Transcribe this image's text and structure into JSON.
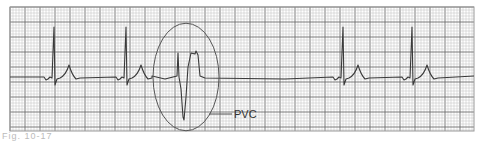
{
  "figure": {
    "type": "ecg-rhythm-strip",
    "annotation_label": "PVC",
    "caption_partial": "Fig. 10-17"
  },
  "grid": {
    "left": 10,
    "top": 7,
    "right": 474,
    "bottom": 131,
    "minor_px": 3,
    "major_every": 5,
    "minor_color": "#bdbdbd",
    "major_color": "#6e6e6e",
    "border_color": "#9a9a9a"
  },
  "trace": {
    "color": "#3a3a3a",
    "baseline_y": 77,
    "normal_beats_x": [
      54,
      126,
      343,
      412
    ],
    "pvc_x": 185
  },
  "annotation": {
    "ellipse": {
      "cx": 186,
      "cy": 77,
      "rx": 33,
      "ry": 64
    },
    "leader_line": {
      "x1": 209,
      "y1": 114,
      "x2": 232,
      "y2": 114
    },
    "label_pos": {
      "x": 234,
      "y": 118
    },
    "color": "#555555"
  }
}
